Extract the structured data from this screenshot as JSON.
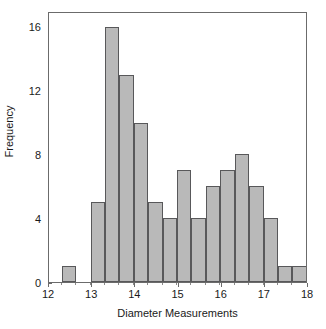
{
  "chart_data": {
    "type": "bar",
    "title": "",
    "subtitle": "",
    "xlabel": "Diameter Measurements",
    "ylabel": "Frequency",
    "xlim": [
      12,
      18
    ],
    "ylim": [
      0,
      17
    ],
    "grid": false,
    "legend": null,
    "bin_width": 0.3333,
    "x_ticks": [
      12,
      13,
      14,
      15,
      16,
      17,
      18
    ],
    "x_tick_labels": [
      "12",
      "13",
      "14",
      "15",
      "16",
      "17",
      "18"
    ],
    "y_ticks": [
      0,
      4,
      8,
      12,
      16
    ],
    "y_tick_labels": [
      "0",
      "4",
      "8",
      "12",
      "16"
    ],
    "bin_edges": [
      12.3,
      12.63,
      12.97,
      13.3,
      13.63,
      13.97,
      14.3,
      14.63,
      14.97,
      15.3,
      15.63,
      15.97,
      16.3,
      16.63,
      16.97,
      17.3,
      17.63
    ],
    "bars": [
      {
        "x0": 12.3,
        "x1": 12.63,
        "value": 1
      },
      {
        "x0": 12.97,
        "x1": 13.3,
        "value": 5
      },
      {
        "x0": 13.3,
        "x1": 13.63,
        "value": 16
      },
      {
        "x0": 13.63,
        "x1": 13.97,
        "value": 13
      },
      {
        "x0": 13.97,
        "x1": 14.3,
        "value": 10
      },
      {
        "x0": 14.3,
        "x1": 14.63,
        "value": 5
      },
      {
        "x0": 14.63,
        "x1": 14.97,
        "value": 4
      },
      {
        "x0": 14.97,
        "x1": 15.3,
        "value": 7
      },
      {
        "x0": 15.3,
        "x1": 15.63,
        "value": 4
      },
      {
        "x0": 15.63,
        "x1": 15.97,
        "value": 6
      },
      {
        "x0": 15.97,
        "x1": 16.3,
        "value": 7
      },
      {
        "x0": 16.3,
        "x1": 16.63,
        "value": 8
      },
      {
        "x0": 16.63,
        "x1": 16.97,
        "value": 6
      },
      {
        "x0": 16.97,
        "x1": 17.3,
        "value": 4
      },
      {
        "x0": 17.3,
        "x1": 17.63,
        "value": 1
      },
      {
        "x0": 17.63,
        "x1": 17.97,
        "value": 1
      },
      {
        "x0": 17.97,
        "x1": 18.3,
        "value": 2
      }
    ],
    "categories": [
      "12.30-12.63",
      "12.97-13.30",
      "13.30-13.63",
      "13.63-13.97",
      "13.97-14.30",
      "14.30-14.63",
      "14.63-14.97",
      "14.97-15.30",
      "15.30-15.63",
      "15.63-15.97",
      "15.97-16.30",
      "16.30-16.63",
      "16.63-16.97",
      "16.97-17.30",
      "17.30-17.63",
      "17.63-17.97",
      "17.97-18.30"
    ],
    "values": [
      1,
      5,
      16,
      13,
      10,
      5,
      4,
      7,
      4,
      6,
      7,
      8,
      6,
      4,
      1,
      1,
      2
    ],
    "colors": {
      "bar_fill": "#b9b9b9",
      "bar_edge": "#58585a",
      "axis": "#6b6b6b",
      "text": "#1a1a1a",
      "background": "#ffffff"
    }
  }
}
